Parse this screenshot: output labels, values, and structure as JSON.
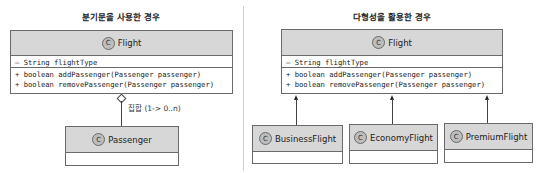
{
  "left_panel": {
    "title": "분기문을 사용한 경우",
    "flight": {
      "badge": "C",
      "name": "Flight",
      "attribute": "– String flightType",
      "methods": [
        "+ boolean addPassenger(Passenger passenger)",
        "+ boolean removePassenger(Passenger passenger)"
      ]
    },
    "relation_label": "집합 (1-> 0..n)",
    "passenger": {
      "badge": "C",
      "name": "Passenger"
    }
  },
  "right_panel": {
    "title": "다형성을 활용한 경우",
    "flight": {
      "badge": "C",
      "name": "Flight",
      "attribute": "– String flightType",
      "methods": [
        "+ boolean addPassenger(Passenger passenger)",
        "+ boolean removePassenger(Passenger passenger)"
      ]
    },
    "subclasses": [
      {
        "badge": "C",
        "name": "BusinessFlight"
      },
      {
        "badge": "C",
        "name": "EconomyFlight"
      },
      {
        "badge": "C",
        "name": "PremiumFlight"
      }
    ]
  }
}
